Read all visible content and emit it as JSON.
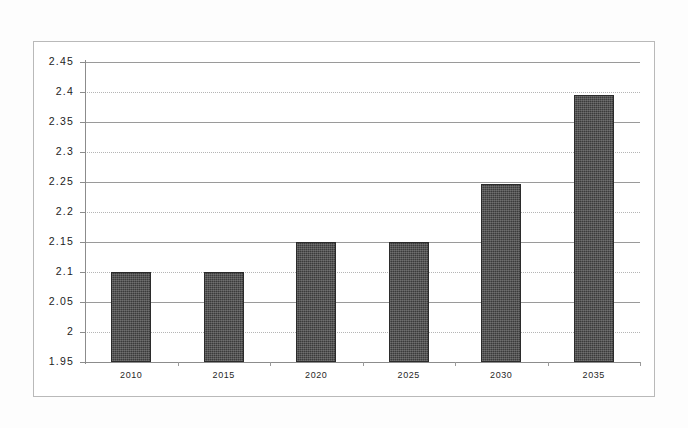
{
  "chart_data": {
    "type": "bar",
    "title": "",
    "subtitle": "",
    "xlabel": "",
    "ylabel": "",
    "categories": [
      "2010",
      "2015",
      "2020",
      "2025",
      "2030",
      "2035"
    ],
    "values": [
      2.1,
      2.1,
      2.15,
      2.15,
      2.247,
      2.395
    ],
    "ylim": [
      1.95,
      2.45
    ],
    "ytick_step": 0.05,
    "yticks": [
      "1.95",
      "2",
      "2.05",
      "2.1",
      "2.15",
      "2.2",
      "2.25",
      "2.3",
      "2.35",
      "2.4",
      "2.45"
    ],
    "ytick_values": [
      1.95,
      2.0,
      2.05,
      2.1,
      2.15,
      2.2,
      2.25,
      2.3,
      2.35,
      2.4,
      2.45
    ],
    "grid": true,
    "legend": "none",
    "series": [
      {
        "name": "",
        "values": [
          2.1,
          2.1,
          2.15,
          2.15,
          2.247,
          2.395
        ]
      }
    ],
    "bar_color": "#3b3b3b",
    "axis_color": "#8c8c8c",
    "gridline_color": "#9a9a9a",
    "frame_color": "#b9b9b9",
    "background_color": "#ffffff"
  },
  "axis": {
    "y_ticks": [
      {
        "label": "2.45",
        "value": 2.45
      },
      {
        "label": "2.4",
        "value": 2.4
      },
      {
        "label": "2.35",
        "value": 2.35
      },
      {
        "label": "2.3",
        "value": 2.3
      },
      {
        "label": "2.25",
        "value": 2.25
      },
      {
        "label": "2.2",
        "value": 2.2
      },
      {
        "label": "2.15",
        "value": 2.15
      },
      {
        "label": "2.1",
        "value": 2.1
      },
      {
        "label": "2.05",
        "value": 2.05
      },
      {
        "label": "2",
        "value": 2.0
      },
      {
        "label": "1.95",
        "value": 1.95
      }
    ],
    "x_ticks": [
      {
        "label": "2010"
      },
      {
        "label": "2015"
      },
      {
        "label": "2020"
      },
      {
        "label": "2025"
      },
      {
        "label": "2030"
      },
      {
        "label": "2035"
      }
    ]
  }
}
